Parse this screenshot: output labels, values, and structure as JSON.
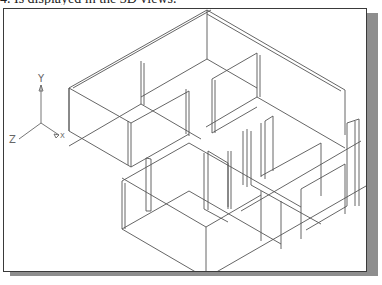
{
  "caption": {
    "text": "4. Is displayed in the 3D views."
  },
  "colors": {
    "wire": "#555555",
    "frame": "#3a3a3a",
    "shadow": "#8e8e8e",
    "background": "#ffffff"
  },
  "ucs_icon": {
    "labels": {
      "y": "Y",
      "z": "Z",
      "x": "X"
    },
    "origin": [
      40,
      122
    ],
    "y_end": [
      40,
      84
    ],
    "z_end": [
      18,
      138
    ],
    "x_end": [
      58,
      134
    ]
  },
  "model": {
    "name": "isometric-floor-plan-wireframe",
    "lines": [
      [
        [
          206,
          9
        ],
        [
          68,
          87
        ],
        [
          68,
          130
        ]
      ],
      [
        [
          210,
          9
        ],
        [
          72,
          87
        ]
      ],
      [
        [
          206,
          9
        ],
        [
          206,
          58
        ]
      ],
      [
        [
          206,
          9
        ],
        [
          344,
          89
        ]
      ],
      [
        [
          206,
          13
        ],
        [
          340,
          90
        ]
      ],
      [
        [
          344,
          89
        ],
        [
          344,
          134
        ]
      ],
      [
        [
          68,
          87
        ],
        [
          130,
          122
        ]
      ],
      [
        [
          68,
          130
        ],
        [
          130,
          166
        ]
      ],
      [
        [
          68,
          87
        ],
        [
          68,
          130
        ]
      ],
      [
        [
          140,
          60
        ],
        [
          140,
          103
        ]
      ],
      [
        [
          143,
          62
        ],
        [
          143,
          104
        ]
      ],
      [
        [
          140,
          103
        ],
        [
          68,
          145
        ]
      ],
      [
        [
          140,
          103
        ],
        [
          200,
          138
        ]
      ],
      [
        [
          206,
          58
        ],
        [
          140,
          96
        ]
      ],
      [
        [
          206,
          58
        ],
        [
          256,
          87
        ]
      ],
      [
        [
          256,
          52
        ],
        [
          256,
          96
        ]
      ],
      [
        [
          259,
          54
        ],
        [
          259,
          96
        ]
      ],
      [
        [
          256,
          52
        ],
        [
          211,
          78
        ]
      ],
      [
        [
          211,
          78
        ],
        [
          211,
          132
        ]
      ],
      [
        [
          214,
          79
        ],
        [
          214,
          132
        ]
      ],
      [
        [
          211,
          132
        ],
        [
          256,
          106
        ]
      ],
      [
        [
          256,
          96
        ],
        [
          205,
          126
        ]
      ],
      [
        [
          256,
          96
        ],
        [
          344,
          147
        ]
      ],
      [
        [
          130,
          122
        ],
        [
          130,
          166
        ]
      ],
      [
        [
          127,
          120
        ],
        [
          127,
          164
        ]
      ],
      [
        [
          130,
          122
        ],
        [
          188,
          90
        ]
      ],
      [
        [
          188,
          90
        ],
        [
          188,
          135
        ]
      ],
      [
        [
          185,
          88
        ],
        [
          185,
          133
        ]
      ],
      [
        [
          130,
          166
        ],
        [
          188,
          133
        ]
      ],
      [
        [
          121,
          180
        ],
        [
          121,
          228
        ]
      ],
      [
        [
          124,
          182
        ],
        [
          124,
          228
        ]
      ],
      [
        [
          121,
          180
        ],
        [
          188,
          142
        ]
      ],
      [
        [
          121,
          228
        ],
        [
          205,
          277
        ]
      ],
      [
        [
          121,
          228
        ],
        [
          188,
          190
        ]
      ],
      [
        [
          145,
          157
        ],
        [
          145,
          210
        ]
      ],
      [
        [
          150,
          158
        ],
        [
          150,
          210
        ]
      ],
      [
        [
          145,
          157
        ],
        [
          150,
          158
        ]
      ],
      [
        [
          145,
          210
        ],
        [
          150,
          210
        ]
      ],
      [
        [
          205,
          226
        ],
        [
          205,
          277
        ]
      ],
      [
        [
          205,
          277
        ],
        [
          365,
          185
        ]
      ],
      [
        [
          205,
          226
        ],
        [
          260,
          194
        ]
      ],
      [
        [
          205,
          226
        ],
        [
          121,
          177
        ]
      ],
      [
        [
          203,
          152
        ],
        [
          203,
          208
        ]
      ],
      [
        [
          207,
          150
        ],
        [
          207,
          209
        ]
      ],
      [
        [
          203,
          208
        ],
        [
          227,
          221
        ]
      ],
      [
        [
          227,
          150
        ],
        [
          227,
          208
        ]
      ],
      [
        [
          230,
          150
        ],
        [
          230,
          208
        ]
      ],
      [
        [
          207,
          150
        ],
        [
          227,
          162
        ]
      ],
      [
        [
          227,
          162
        ],
        [
          227,
          206
        ]
      ],
      [
        [
          242,
          130
        ],
        [
          242,
          184
        ]
      ],
      [
        [
          246,
          128
        ],
        [
          246,
          186
        ]
      ],
      [
        [
          250,
          130
        ],
        [
          250,
          184
        ]
      ],
      [
        [
          260,
          122
        ],
        [
          260,
          176
        ]
      ],
      [
        [
          264,
          120
        ],
        [
          264,
          178
        ]
      ],
      [
        [
          264,
          120
        ],
        [
          272,
          115
        ]
      ],
      [
        [
          272,
          115
        ],
        [
          272,
          170
        ]
      ],
      [
        [
          260,
          175
        ],
        [
          320,
          142
        ]
      ],
      [
        [
          320,
          142
        ],
        [
          320,
          195
        ]
      ],
      [
        [
          260,
          190
        ],
        [
          260,
          240
        ]
      ],
      [
        [
          240,
          210
        ],
        [
          360,
          140
        ]
      ],
      [
        [
          280,
          200
        ],
        [
          280,
          248
        ]
      ],
      [
        [
          300,
          188
        ],
        [
          300,
          238
        ]
      ],
      [
        [
          300,
          188
        ],
        [
          344,
          163
        ]
      ],
      [
        [
          344,
          163
        ],
        [
          344,
          213
        ]
      ],
      [
        [
          354,
          120
        ],
        [
          354,
          205
        ]
      ],
      [
        [
          358,
          118
        ],
        [
          358,
          205
        ]
      ],
      [
        [
          346,
          122
        ],
        [
          346,
          205
        ]
      ],
      [
        [
          346,
          122
        ],
        [
          358,
          118
        ]
      ],
      [
        [
          346,
          205
        ],
        [
          305,
          229
        ]
      ],
      [
        [
          250,
          184
        ],
        [
          320,
          223
        ]
      ],
      [
        [
          188,
          142
        ],
        [
          300,
          206
        ]
      ],
      [
        [
          188,
          190
        ],
        [
          280,
          243
        ]
      ]
    ]
  }
}
